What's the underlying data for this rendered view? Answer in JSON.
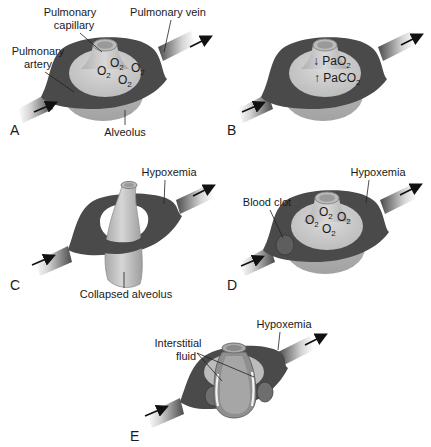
{
  "figure": {
    "colors": {
      "vessel_dark": "#4a4a4a",
      "vessel_light": "#cfcfcf",
      "alveolus_fill": "#c8c8c8",
      "alveolus_shade": "#a9a9a9",
      "background": "#ffffff",
      "text": "#1a1a1a"
    },
    "panels": [
      {
        "id": "A",
        "letter": "A",
        "labels": {
          "capillary": "Pulmonary capillary",
          "capillary_line1": "Pulmonary",
          "capillary_line2": "capillary",
          "vein": "Pulmonary vein",
          "artery_line1": "Pulmonary",
          "artery_line2": "artery",
          "alveolus": "Alveolus"
        },
        "gas_labels": [
          "O2",
          "O2",
          "O2",
          "O2"
        ],
        "gas_base": "O",
        "gas_sub": "2"
      },
      {
        "id": "B",
        "letter": "B",
        "gas_labels": [
          {
            "arrow": "↓",
            "base": "PaO",
            "sub": "2",
            "meaning": "decreased PaO2"
          },
          {
            "arrow": "↑",
            "base": "PaCO",
            "sub": "2",
            "meaning": "increased PaCO2"
          }
        ]
      },
      {
        "id": "C",
        "letter": "C",
        "labels": {
          "hypoxemia": "Hypoxemia",
          "collapsed": "Collapsed alveolus"
        }
      },
      {
        "id": "D",
        "letter": "D",
        "labels": {
          "hypoxemia": "Hypoxemia",
          "clot": "Blood clot"
        },
        "gas_base": "O",
        "gas_sub": "2"
      },
      {
        "id": "E",
        "letter": "E",
        "labels": {
          "hypoxemia": "Hypoxemia",
          "interstitial_line1": "Interstitial",
          "interstitial_line2": "fluid"
        }
      }
    ]
  }
}
